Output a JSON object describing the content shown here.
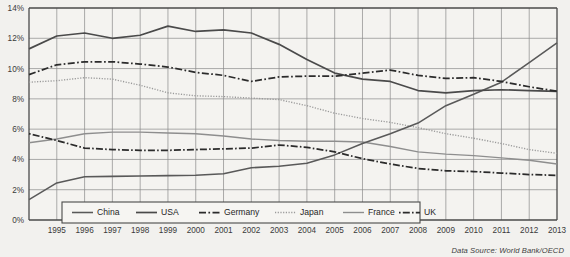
{
  "chart_data": {
    "type": "line",
    "title": "",
    "subtitle": "",
    "xlabel": "",
    "ylabel": "",
    "xlim": [
      1994,
      2013
    ],
    "ylim": [
      0,
      14
    ],
    "grid": true,
    "legend_position": "bottom-left-inside",
    "y_tick_labels": [
      "0%",
      "2%",
      "4%",
      "6%",
      "8%",
      "10%",
      "12%",
      "14%"
    ],
    "y_ticks": [
      0,
      2,
      4,
      6,
      8,
      10,
      12,
      14
    ],
    "x_tick_labels": [
      "1995",
      "1996",
      "1997",
      "1998",
      "1999",
      "2000",
      "2001",
      "2002",
      "2003",
      "2004",
      "2005",
      "2006",
      "2007",
      "2008",
      "2009",
      "2010",
      "2011",
      "2012",
      "2013"
    ],
    "x": [
      1994,
      1995,
      1996,
      1997,
      1998,
      1999,
      2000,
      2001,
      2002,
      2003,
      2004,
      2005,
      2006,
      2007,
      2008,
      2009,
      2010,
      2011,
      2012,
      2013
    ],
    "annotation": "Data Source: World Bank/OECD",
    "series": [
      {
        "name": "China",
        "style": "solid",
        "color": "#595959",
        "values": [
          1.35,
          2.45,
          2.85,
          2.88,
          2.9,
          2.93,
          2.96,
          3.05,
          3.45,
          3.55,
          3.75,
          4.3,
          5.05,
          5.7,
          6.4,
          7.55,
          8.3,
          9.1,
          10.4,
          11.7
        ]
      },
      {
        "name": "USA",
        "style": "solid",
        "color": "#4a4a4a",
        "values": [
          11.3,
          12.15,
          12.35,
          12.0,
          12.2,
          12.8,
          12.45,
          12.55,
          12.35,
          11.6,
          10.6,
          9.7,
          9.3,
          9.15,
          8.55,
          8.4,
          8.55,
          8.6,
          8.55,
          8.5
        ]
      },
      {
        "name": "Germany",
        "style": "dash-dot",
        "color": "#2b2b2b",
        "values": [
          9.6,
          10.25,
          10.45,
          10.45,
          10.3,
          10.1,
          9.75,
          9.55,
          9.15,
          9.45,
          9.5,
          9.5,
          9.7,
          9.9,
          9.55,
          9.35,
          9.4,
          9.15,
          8.8,
          8.5
        ]
      },
      {
        "name": "Japan",
        "style": "dotted",
        "color": "#9a9a9a",
        "values": [
          9.1,
          9.2,
          9.4,
          9.3,
          8.9,
          8.4,
          8.2,
          8.15,
          8.05,
          7.95,
          7.55,
          7.05,
          6.7,
          6.45,
          6.1,
          5.7,
          5.4,
          5.05,
          4.65,
          4.4
        ]
      },
      {
        "name": "France",
        "style": "solid",
        "color": "#8e8e8e",
        "values": [
          5.1,
          5.35,
          5.7,
          5.8,
          5.8,
          5.75,
          5.7,
          5.55,
          5.35,
          5.25,
          5.2,
          5.2,
          5.15,
          4.85,
          4.5,
          4.35,
          4.25,
          4.1,
          3.95,
          3.7
        ]
      },
      {
        "name": "UK",
        "style": "dash-dot",
        "color": "#2b2b2b",
        "values": [
          5.7,
          5.25,
          4.75,
          4.65,
          4.6,
          4.6,
          4.65,
          4.7,
          4.75,
          4.95,
          4.8,
          4.5,
          4.05,
          3.7,
          3.4,
          3.25,
          3.2,
          3.1,
          3.0,
          2.95
        ]
      }
    ]
  },
  "legend": {
    "items": [
      {
        "label": "China",
        "key": "s-china"
      },
      {
        "label": "USA",
        "key": "s-usa"
      },
      {
        "label": "Germany",
        "key": "s-germany"
      },
      {
        "label": "Japan",
        "key": "s-japan"
      },
      {
        "label": "France",
        "key": "s-france"
      },
      {
        "label": "UK",
        "key": "s-uk"
      }
    ]
  },
  "footer": {
    "source": "Data Source: World Bank/OECD"
  }
}
